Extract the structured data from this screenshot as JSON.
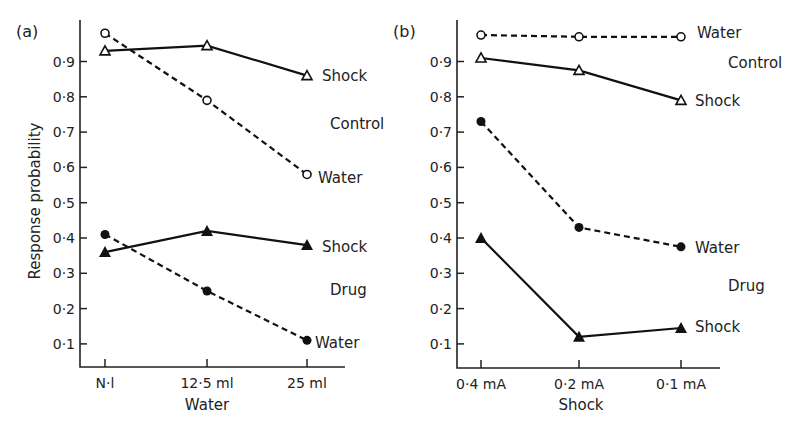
{
  "figure": {
    "y_axis_title": "Response probability",
    "y_ticks": [
      "0·1",
      "0·2",
      "0·3",
      "0·4",
      "0·5",
      "0·6",
      "0·7",
      "0·8",
      "0·9"
    ]
  },
  "chart_data": [
    {
      "type": "line",
      "panel": "(a)",
      "title": "(a)",
      "xlabel": "Water",
      "ylabel": "Response probability",
      "categories": [
        "Nil",
        "12·5 ml",
        "25 ml"
      ],
      "ylim": [
        0.03,
        1.02
      ],
      "grid": false,
      "series": [
        {
          "name": "Control Water",
          "group": "Control",
          "label": "Water",
          "marker": "open-circle",
          "line": "dashed",
          "values": [
            0.98,
            0.79,
            0.58
          ]
        },
        {
          "name": "Control Shock",
          "group": "Control",
          "label": "Shock",
          "marker": "open-triangle",
          "line": "solid",
          "values": [
            0.93,
            0.945,
            0.86
          ]
        },
        {
          "name": "Drug Shock",
          "group": "Drug",
          "label": "Shock",
          "marker": "filled-triangle",
          "line": "solid",
          "values": [
            0.36,
            0.42,
            0.38
          ]
        },
        {
          "name": "Drug Water",
          "group": "Drug",
          "label": "Water",
          "marker": "filled-circle",
          "line": "dashed",
          "values": [
            0.41,
            0.25,
            0.11
          ]
        }
      ],
      "annotations": [
        "Shock",
        "Control",
        "Water",
        "Shock",
        "Drug",
        "Water"
      ]
    },
    {
      "type": "line",
      "panel": "(b)",
      "title": "(b)",
      "xlabel": "Shock",
      "ylabel": "Response probability",
      "categories": [
        "0·4 mA",
        "0·2 mA",
        "0·1 mA"
      ],
      "ylim": [
        0.03,
        1.02
      ],
      "grid": false,
      "series": [
        {
          "name": "Control Water",
          "group": "Control",
          "label": "Water",
          "marker": "open-circle",
          "line": "dashed",
          "values": [
            0.975,
            0.97,
            0.97
          ]
        },
        {
          "name": "Control Shock",
          "group": "Control",
          "label": "Shock",
          "marker": "open-triangle",
          "line": "solid",
          "values": [
            0.91,
            0.875,
            0.79
          ]
        },
        {
          "name": "Drug Water",
          "group": "Drug",
          "label": "Water",
          "marker": "filled-circle",
          "line": "dashed",
          "values": [
            0.73,
            0.43,
            0.375
          ]
        },
        {
          "name": "Drug Shock",
          "group": "Drug",
          "label": "Shock",
          "marker": "filled-triangle",
          "line": "solid",
          "values": [
            0.4,
            0.12,
            0.145
          ]
        }
      ],
      "annotations": [
        "Water",
        "Control",
        "Shock",
        "Water",
        "Drug",
        "Shock"
      ]
    }
  ],
  "panels": {
    "a": {
      "label": "(a)",
      "x_title": "Water",
      "x_ticks": [
        "N·l",
        "12·5 ml",
        "25 ml"
      ],
      "text_labels": {
        "control_shock": "Shock",
        "control": "Control",
        "control_water": "Water",
        "drug_shock": "Shock",
        "drug": "Drug",
        "drug_water": "Water"
      }
    },
    "b": {
      "label": "(b)",
      "x_title": "Shock",
      "x_ticks": [
        "0·4 mA",
        "0·2 mA",
        "0·1 mA"
      ],
      "text_labels": {
        "control_water": "Water",
        "control": "Control",
        "control_shock": "Shock",
        "drug_water": "Water",
        "drug": "Drug",
        "drug_shock": "Shock"
      }
    }
  }
}
